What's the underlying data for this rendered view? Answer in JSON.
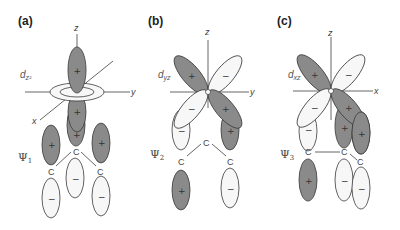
{
  "figure": {
    "colors": {
      "positive_lobe": "#8a8a8a",
      "negative_lobe": "#f7f7f7",
      "outline": "#3a3a3a",
      "axis": "#555555"
    },
    "panels": [
      {
        "label": "(a)",
        "orbital": "d",
        "orbital_sub": "z²",
        "axes": {
          "vertical": "z",
          "horizontal": "y",
          "diagonal": "x"
        },
        "psi": "Ψ",
        "psi_sub": "1",
        "atoms": [
          "C",
          "C",
          "C"
        ],
        "signs": {
          "d_upper": "+",
          "d_lower": "+",
          "p_upper": [
            "+",
            "+",
            "+"
          ],
          "p_lower": [
            "−",
            "−",
            "−"
          ]
        }
      },
      {
        "label": "(b)",
        "orbital": "d",
        "orbital_sub": "yz",
        "axes": {
          "vertical": "z",
          "horizontal": "y"
        },
        "psi": "Ψ",
        "psi_sub": "2",
        "atoms": [
          "C",
          "C",
          "C"
        ],
        "signs": {
          "d_upper_left": "+",
          "d_upper_right": "−",
          "d_lower_left": "−",
          "d_lower_right": "+",
          "p_left_upper": "−",
          "p_left_lower": "+",
          "p_right_upper": "+",
          "p_right_lower": "−"
        }
      },
      {
        "label": "(c)",
        "orbital": "d",
        "orbital_sub": "xz",
        "axes": {
          "vertical": "z",
          "horizontal": "x"
        },
        "psi": "Ψ",
        "psi_sub": "3",
        "atoms": [
          "C",
          "C",
          "C"
        ],
        "signs": {
          "d_upper_left": "+",
          "d_upper_right": "−",
          "d_lower_left": "−",
          "d_lower_right": "+",
          "p_left_upper": "−",
          "p_left_lower": "+",
          "p_mid_upper": "+",
          "p_mid_lower": "−",
          "p_right_upper": "+",
          "p_right_lower": "−"
        }
      }
    ]
  }
}
